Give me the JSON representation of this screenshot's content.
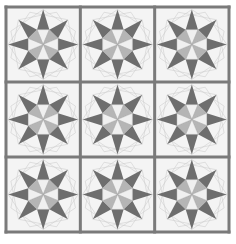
{
  "quilt": {
    "title": "Eight-pointed star quilt",
    "rows": 3,
    "cols": 3,
    "block_motif": "eight-pointed-star",
    "colors": {
      "background": "#ffffff",
      "block_fill": "#f4f4f4",
      "sashing": "#7a7a7a",
      "star_points": "#6e6e6e",
      "center_light": "#f0f0f0",
      "center_mid": "#b5b5b5",
      "guide_lines": "#cfcfcf"
    }
  }
}
